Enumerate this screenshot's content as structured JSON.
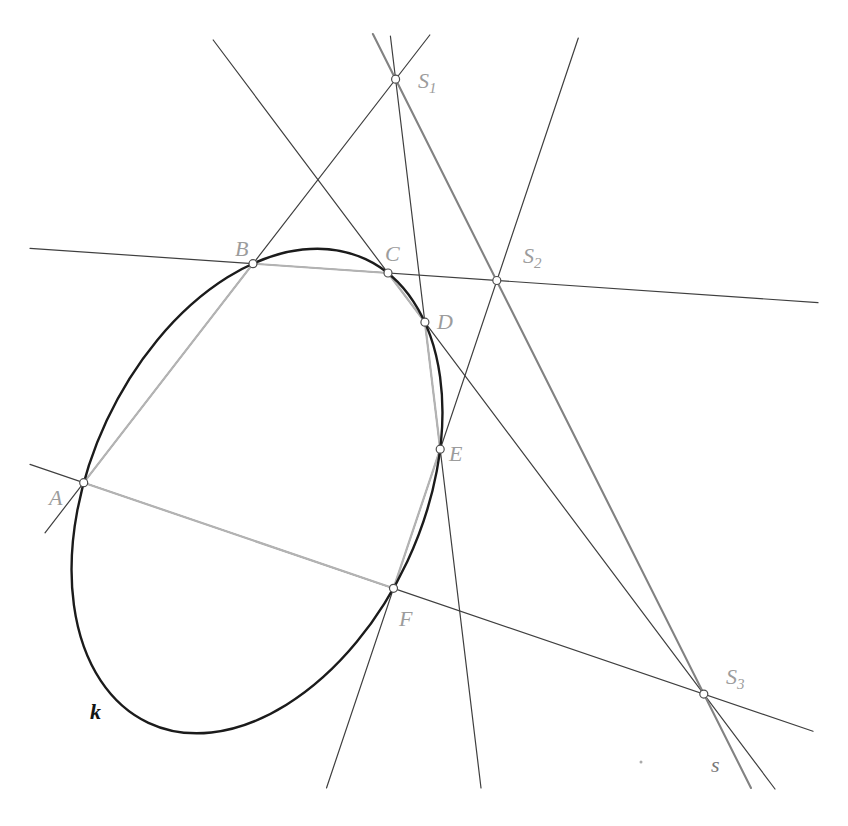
{
  "figure": {
    "width": 848,
    "height": 826,
    "background": "#ffffff",
    "conic": {
      "label": "k",
      "cx": 257,
      "cy": 491,
      "rx": 256,
      "ry": 166,
      "rotation_deg": -64.9,
      "color": "#1b1b1b",
      "stroke_width": 2.4,
      "label_x": 90,
      "label_y": 719,
      "label_color": "#141414"
    },
    "hexagon": {
      "stroke_color": "#b3b3b3",
      "stroke_width": 2.2,
      "vertices": [
        {
          "name": "A",
          "x": 83.7,
          "y": 482.7,
          "label_x": 49,
          "label_y": 505
        },
        {
          "name": "B",
          "x": 253,
          "y": 263.7,
          "label_x": 235,
          "label_y": 256
        },
        {
          "name": "C",
          "x": 388,
          "y": 273,
          "label_x": 385,
          "label_y": 261
        },
        {
          "name": "D",
          "x": 424.9,
          "y": 322.2,
          "label_x": 437,
          "label_y": 329
        },
        {
          "name": "E",
          "x": 440.2,
          "y": 449.2,
          "label_x": 449,
          "label_y": 461
        },
        {
          "name": "F",
          "x": 393.5,
          "y": 588.3,
          "label_x": 399,
          "label_y": 626
        }
      ]
    },
    "lines": {
      "color": "#3f3f3f",
      "width": 1.2,
      "segments": [
        {
          "name": "AB-extended",
          "x1": 45,
          "y1": 532.8,
          "x2": 429.8,
          "y2": 35
        },
        {
          "name": "BC-extended",
          "x1": 30,
          "y1": 248.3,
          "x2": 818,
          "y2": 302.6
        },
        {
          "name": "CD-extended",
          "x1": 213.2,
          "y1": 40,
          "x2": 775,
          "y2": 789
        },
        {
          "name": "DE-extended",
          "x1": 390.4,
          "y1": 36,
          "x2": 481,
          "y2": 788
        },
        {
          "name": "EF-extended",
          "x1": 578.3,
          "y1": 38,
          "x2": 326.5,
          "y2": 788
        },
        {
          "name": "FA-extended",
          "x1": 30,
          "y1": 464.4,
          "x2": 813,
          "y2": 731.3
        }
      ]
    },
    "pascal_line": {
      "label": "s",
      "x1": 372.9,
      "y1": 34,
      "x2": 751,
      "y2": 788,
      "color": "#828282",
      "width": 2.1,
      "label_x": 711,
      "label_y": 772,
      "label_color": "#787878"
    },
    "intersections": [
      {
        "name": "S1",
        "base": "S",
        "sub": "1",
        "x": 395.6,
        "y": 79.2,
        "label_x": 418,
        "label_y": 88
      },
      {
        "name": "S2",
        "base": "S",
        "sub": "2",
        "x": 496.8,
        "y": 280.5,
        "label_x": 523,
        "label_y": 263
      },
      {
        "name": "S3",
        "base": "S",
        "sub": "3",
        "x": 703.8,
        "y": 694.1,
        "label_x": 726,
        "label_y": 684
      }
    ],
    "point_style": {
      "radius": 4,
      "fill": "#ffffff",
      "stroke": "#4d4d4d",
      "stroke_width": 1.2
    },
    "label_style": {
      "color": "#9c9c9c",
      "font_size": 22,
      "sub_font_size": 15
    },
    "artifacts": [
      {
        "name": "scan-speck",
        "x": 641,
        "y": 762,
        "r": 1.5,
        "color": "#aaaaaa"
      }
    ]
  }
}
